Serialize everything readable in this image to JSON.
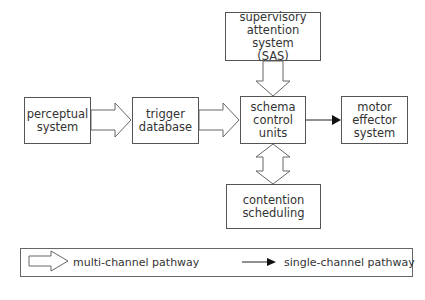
{
  "diagram": {
    "nodes": {
      "sas": {
        "lines": [
          "supervisory",
          "attention system",
          "(SAS)"
        ]
      },
      "perceptual": {
        "lines": [
          "perceptual",
          "system"
        ]
      },
      "trigger": {
        "lines": [
          "trigger",
          "database"
        ]
      },
      "schema": {
        "lines": [
          "schema",
          "control",
          "units"
        ]
      },
      "motor": {
        "lines": [
          "motor",
          "effector",
          "system"
        ]
      },
      "contention": {
        "lines": [
          "contention",
          "scheduling"
        ]
      }
    },
    "edges": [
      {
        "from": "perceptual system",
        "to": "trigger database",
        "type": "multi-channel"
      },
      {
        "from": "trigger database",
        "to": "schema control units",
        "type": "multi-channel"
      },
      {
        "from": "supervisory attention system (SAS)",
        "to": "schema control units",
        "type": "multi-channel"
      },
      {
        "from": "schema control units",
        "to": "contention scheduling",
        "type": "multi-channel",
        "bidirectional": true
      },
      {
        "from": "schema control units",
        "to": "motor effector system",
        "type": "single-channel"
      }
    ]
  },
  "legend": {
    "multi_channel": "multi-channel pathway",
    "single_channel": "single-channel pathway"
  },
  "colors": {
    "stroke": "#555555",
    "arrow_fill": "#111111",
    "background": "#ffffff"
  }
}
